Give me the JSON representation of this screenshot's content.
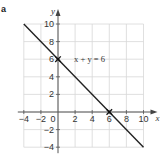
{
  "figure_label": "a",
  "chart_data": {
    "type": "line",
    "title": "",
    "xlabel": "x",
    "ylabel": "y",
    "xlim": [
      -4,
      10
    ],
    "ylim": [
      -4,
      10
    ],
    "grid": true,
    "grid_step": 2,
    "x_ticks": [
      -4,
      -2,
      0,
      2,
      4,
      6,
      8,
      10
    ],
    "y_ticks": [
      -4,
      -2,
      2,
      4,
      6,
      8,
      10
    ],
    "x_tick_labels": [
      "−4",
      "−2",
      "0",
      "2",
      "4",
      "6",
      "8",
      "10"
    ],
    "y_tick_labels": [
      "−4",
      "−2",
      "2",
      "4",
      "6",
      "8",
      "10"
    ],
    "series": [
      {
        "name": "x + y = 6",
        "x": [
          -4,
          10
        ],
        "y": [
          10,
          -4
        ]
      }
    ],
    "marked_points": [
      {
        "x": 0,
        "y": 6
      },
      {
        "x": 6,
        "y": 0
      }
    ],
    "annotations": [
      {
        "text": "x + y = 6",
        "x": 2,
        "y": 6
      }
    ],
    "line_color": "#222222",
    "grid_color": "#d8d8d8"
  }
}
